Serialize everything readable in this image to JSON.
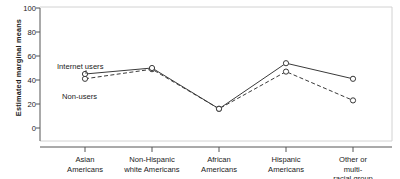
{
  "chart_data": {
    "type": "line",
    "title": "",
    "xlabel": "",
    "ylabel": "Estimated marginal means",
    "ylim": [
      0,
      100
    ],
    "yticks": [
      0,
      20,
      40,
      60,
      80,
      100
    ],
    "grid": false,
    "legend_position": "inline-annotation",
    "categories": [
      "Asian\nAmericans",
      "Non-Hispanic\nwhite Americans",
      "African\nAmericans",
      "Hispanic\nAmericans",
      "Other or multi-\nracial group"
    ],
    "series": [
      {
        "name": "Internet users",
        "style": "solid",
        "marker": "circle",
        "color": "#3a3a3a",
        "values": [
          45,
          50,
          16,
          54,
          41
        ]
      },
      {
        "name": "Non-users",
        "style": "dashed",
        "marker": "circle",
        "color": "#3a3a3a",
        "values": [
          41,
          49,
          16,
          47,
          23
        ]
      }
    ],
    "annotations": [
      {
        "text": "Internet users",
        "x": 57,
        "y": 66
      },
      {
        "text": "Non-users",
        "x": 62,
        "y": 96
      }
    ]
  },
  "axis": {
    "y_tick_labels": [
      "100",
      "80",
      "60",
      "40",
      "20",
      "0"
    ],
    "y_axis_title": "Estimated marginal means"
  },
  "colors": {
    "line": "#3a3a3a",
    "axis": "#555555",
    "frame": "#cfcfcf",
    "text": "#1a1a1a",
    "background": "#ffffff"
  }
}
